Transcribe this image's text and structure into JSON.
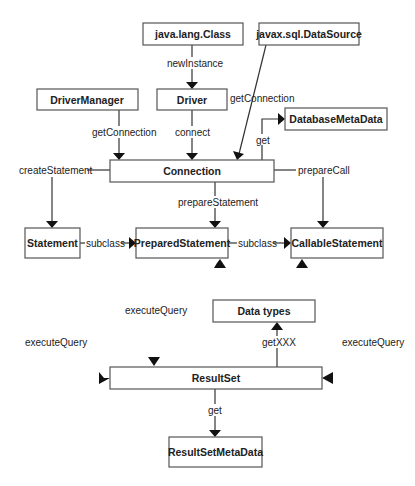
{
  "diagram": {
    "nodes": {
      "java_lang_class": "java.lang.Class",
      "javax_sql_datasource": "javax.sql.DataSource",
      "driver_manager": "DriverManager",
      "driver": "Driver",
      "connection": "Connection",
      "database_metadata": "DatabaseMetaData",
      "statement": "Statement",
      "prepared_statement": "PreparedStatement",
      "callable_statement": "CallableStatement",
      "data_types": "Data types",
      "result_set": "ResultSet",
      "result_set_metadata": "ResultSetMetaData"
    },
    "edges": {
      "new_instance": "newInstance",
      "dm_get_connection": "getConnection",
      "ds_get_connection": "getConnection",
      "connect": "connect",
      "get_dbmd": "get",
      "create_statement": "createStatement",
      "prepare_statement": "prepareStatement",
      "prepare_call": "prepareCall",
      "subclass_1": "subclass",
      "subclass_2": "subclass",
      "get_xxx": "getXXX",
      "get_rsmd": "get",
      "execute_query_left": "executeQuery",
      "execute_query_mid": "executeQuery",
      "execute_query_right": "executeQuery"
    }
  }
}
